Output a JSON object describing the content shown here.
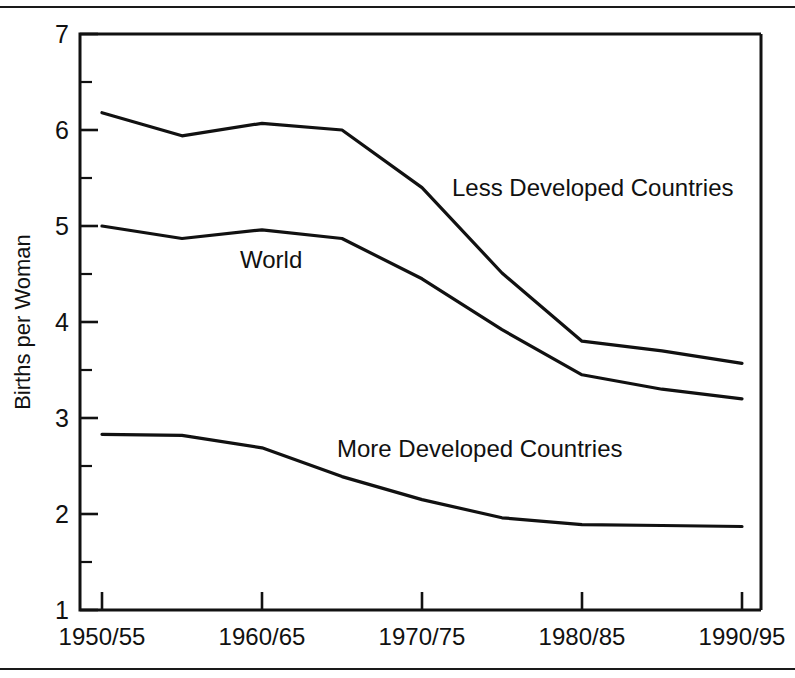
{
  "chart_data": {
    "type": "line",
    "title": "",
    "xlabel": "",
    "ylabel": "Births per Woman",
    "ylim": [
      1,
      7
    ],
    "yticks": [
      1,
      2,
      3,
      4,
      5,
      6,
      7
    ],
    "ytick_labels": [
      "1",
      "2",
      "3",
      "4",
      "5",
      "6",
      "7"
    ],
    "yminor_ticks": [
      1.5,
      2.5,
      3.5,
      4.5,
      5.5,
      6.5
    ],
    "grid": false,
    "legend_position": "inline-annotations",
    "x": [
      "1950/55",
      "1955/60",
      "1960/65",
      "1965/70",
      "1970/75",
      "1975/80",
      "1980/85",
      "1985/90",
      "1990/95"
    ],
    "xtick_labels": [
      "1950/55",
      "1960/65",
      "1970/75",
      "1980/85",
      "1990/95"
    ],
    "xtick_values": [
      "1950/55",
      "1960/65",
      "1970/75",
      "1980/85",
      "1990/95"
    ],
    "categories": [
      "1950/55",
      "1955/60",
      "1960/65",
      "1965/70",
      "1970/75",
      "1975/80",
      "1980/85",
      "1985/90",
      "1990/95"
    ],
    "series": [
      {
        "name": "Less Developed Countries",
        "values": [
          6.18,
          5.94,
          6.07,
          6.0,
          5.4,
          4.51,
          3.8,
          3.7,
          3.57
        ]
      },
      {
        "name": "World",
        "values": [
          5.0,
          4.87,
          4.96,
          4.87,
          4.45,
          3.92,
          3.45,
          3.3,
          3.2
        ]
      },
      {
        "name": "More Developed Countries",
        "values": [
          2.83,
          2.82,
          2.69,
          2.39,
          2.15,
          1.96,
          1.89,
          1.88,
          1.87
        ]
      }
    ],
    "annotations": [
      {
        "text": "Less Developed Countries",
        "x": 452,
        "y": 196
      },
      {
        "text": "World",
        "x": 240,
        "y": 268
      },
      {
        "text": "More Developed Countries",
        "x": 337,
        "y": 457
      }
    ]
  },
  "axes": {
    "y_title": "Births per Woman",
    "y_labels": [
      "7",
      "6",
      "5",
      "4",
      "3",
      "2",
      "1"
    ],
    "x_labels": [
      "1950/55",
      "1960/65",
      "1970/75",
      "1980/85",
      "1990/95"
    ]
  },
  "colors": {
    "line": "#111111",
    "frame": "#111111",
    "background": "#ffffff"
  }
}
